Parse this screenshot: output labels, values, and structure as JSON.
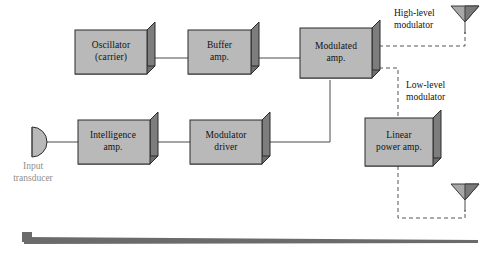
{
  "diagram": {
    "type": "block-diagram",
    "blocks": [
      {
        "id": "oscillator",
        "label": "Oscillator\n(carrier)",
        "x": 75,
        "y": 30,
        "w": 72,
        "h": 44
      },
      {
        "id": "buffer",
        "label": "Buffer\namp.",
        "x": 188,
        "y": 30,
        "w": 63,
        "h": 44
      },
      {
        "id": "modulated",
        "label": "Modulated\namp.",
        "x": 300,
        "y": 28,
        "w": 72,
        "h": 50
      },
      {
        "id": "intelligence",
        "label": "Intelligence\namp.",
        "x": 78,
        "y": 120,
        "w": 72,
        "h": 44
      },
      {
        "id": "moddriver",
        "label": "Modulator\ndriver",
        "x": 190,
        "y": 120,
        "w": 72,
        "h": 44
      },
      {
        "id": "linearpower",
        "label": "Linear\npower amp.",
        "x": 365,
        "y": 118,
        "w": 68,
        "h": 48
      }
    ],
    "annotations": [
      {
        "id": "high-level",
        "label": "High-level\nmodulator",
        "x": 394,
        "y": 8
      },
      {
        "id": "low-level",
        "label": "Low-level\nmodulator",
        "x": 406,
        "y": 80
      }
    ],
    "input_transducer": {
      "label": "Input\ntransducer",
      "x": 14,
      "y": 160
    },
    "antennas": [
      {
        "id": "antenna-top",
        "cx": 465,
        "cy": 18
      },
      {
        "id": "antenna-bottom",
        "cx": 465,
        "cy": 196
      }
    ],
    "colors": {
      "block_face": "#b9b9b9",
      "block_side": "#7d7d7d",
      "outline": "#2b2b2b",
      "wire": "#4a4a4a",
      "dashed": "#555555",
      "muted_text": "#8e8e8e",
      "rule": "#6b6b6b"
    }
  }
}
